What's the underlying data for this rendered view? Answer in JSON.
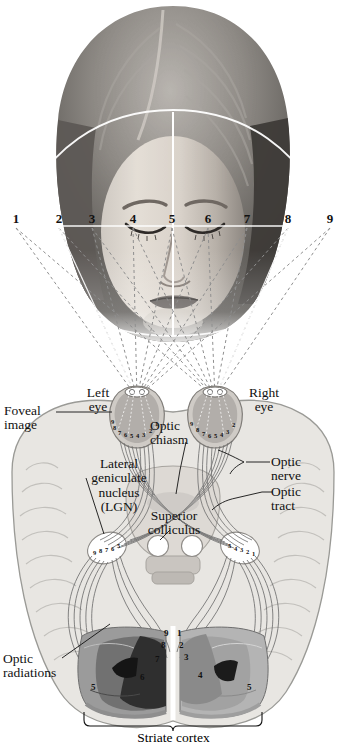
{
  "figure": {
    "type": "anatomical-diagram"
  },
  "visual_field": {
    "description": "Numbered positions across the horizontal visual field in front of the subject's face",
    "numbers": [
      "1",
      "2",
      "3",
      "4",
      "5",
      "6",
      "7",
      "8",
      "9"
    ],
    "x_positions": [
      16,
      59,
      92,
      133,
      172,
      208,
      247,
      288,
      330
    ],
    "y": 218
  },
  "photo": {
    "subject": "front view of a woman's head, eyes and nose visible, looking forward"
  },
  "labels": {
    "foveal_image": "Foveal\nimage",
    "left_eye": "Left\neye",
    "right_eye": "Right\neye",
    "optic_chiasm": "Optic\nchiasm",
    "optic_nerve": "Optic\nnerve",
    "optic_tract": "Optic\ntract",
    "lgn": "Lateral\ngeniculate\nnucleus\n(LGN)",
    "superior_colliculus": "Superior\ncolliculus",
    "optic_radiations": "Optic\nradiations",
    "striate_cortex": "Striate cortex"
  },
  "retina": {
    "left_eye_numbers": [
      "9",
      "8",
      "7",
      "6",
      "5",
      "4",
      "3",
      "2",
      "1"
    ],
    "right_eye_numbers": [
      "9",
      "8",
      "7",
      "6",
      "5",
      "4",
      "3",
      "2"
    ]
  },
  "lgn_numbers": {
    "left": [
      "9",
      "8",
      "7",
      "6",
      "5"
    ],
    "right": [
      "5",
      "4",
      "3",
      "2",
      "1"
    ]
  },
  "cortex_numbers": {
    "left_hemisphere": [
      "9",
      "8",
      "7",
      "6",
      "5"
    ],
    "right_hemisphere": [
      "1",
      "2",
      "3",
      "4",
      "5"
    ]
  },
  "colors": {
    "ink": "#111111",
    "brain_fill": "#e6e4e0",
    "brain_stroke": "#9a9a96",
    "cortex_dark": "#3a3a3a",
    "cortex_mid": "#8c8c8c",
    "cortex_light": "#bdbdbd",
    "guide_white": "#ffffff",
    "tract_stroke": "#707070"
  }
}
